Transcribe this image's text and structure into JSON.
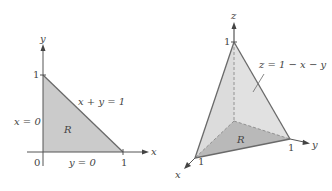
{
  "left_figure": {
    "axis_x_label": "x",
    "axis_y_label": "y",
    "origin_label": "0",
    "x_tick_label": "1",
    "y_tick_label": "1",
    "hypotenuse_label": "x + y = 1",
    "left_edge_label": "x = 0",
    "bottom_edge_label": "y = 0",
    "region_label": "R"
  },
  "right_figure": {
    "axis_x_label": "x",
    "axis_y_label": "y",
    "axis_z_label": "z",
    "x_tick_label": "1",
    "y_tick_label": "1",
    "z_tick_label": "1",
    "surface_label": "z = 1 − x − y",
    "region_label": "R"
  },
  "colors": {
    "region_fill": "#c9c9c9",
    "surface_fill": "#dcdcdc",
    "base_fill": "#b9b9b9",
    "edge": "#6a6a6a",
    "axis": "#555555"
  }
}
